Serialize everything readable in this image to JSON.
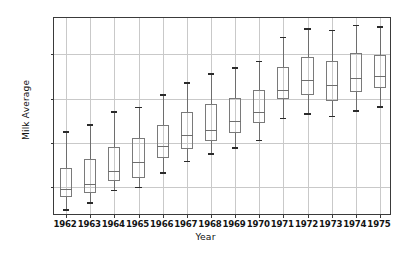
{
  "chart_data": {
    "type": "box",
    "title": "",
    "xlabel": "Year",
    "ylabel": "Milk Average",
    "categories": [
      "1962",
      "1963",
      "1964",
      "1965",
      "1966",
      "1967",
      "1968",
      "1969",
      "1970",
      "1971",
      "1972",
      "1973",
      "1974",
      "1975"
    ],
    "xtick_labels": [
      "1962",
      "1963",
      "1964",
      "1965",
      "1966",
      "1967",
      "1968",
      "1969",
      "1970",
      "1971",
      "1972",
      "1973",
      "1974",
      "1975"
    ],
    "ytick_labels": [
      "600",
      "700",
      "800",
      "900"
    ],
    "yticks": [
      600,
      700,
      800,
      900
    ],
    "ylim": [
      535,
      982
    ],
    "grid": true,
    "legend": null,
    "boxes": [
      {
        "category": "1962",
        "whisker_low": 551,
        "q1": 577,
        "median": 597,
        "q3": 644,
        "whisker_high": 727
      },
      {
        "category": "1963",
        "whisker_low": 566,
        "q1": 586,
        "median": 608,
        "q3": 664,
        "whisker_high": 742
      },
      {
        "category": "1964",
        "whisker_low": 594,
        "q1": 615,
        "median": 636,
        "q3": 691,
        "whisker_high": 771
      },
      {
        "category": "1965",
        "whisker_low": 601,
        "q1": 621,
        "median": 656,
        "q3": 711,
        "whisker_high": 782
      },
      {
        "category": "1966",
        "whisker_low": 634,
        "q1": 665,
        "median": 693,
        "q3": 741,
        "whisker_high": 810
      },
      {
        "category": "1967",
        "whisker_low": 660,
        "q1": 686,
        "median": 717,
        "q3": 770,
        "whisker_high": 837
      },
      {
        "category": "1968",
        "whisker_low": 677,
        "q1": 705,
        "median": 729,
        "q3": 787,
        "whisker_high": 857
      },
      {
        "category": "1969",
        "whisker_low": 690,
        "q1": 723,
        "median": 749,
        "q3": 801,
        "whisker_high": 871
      },
      {
        "category": "1970",
        "whisker_low": 707,
        "q1": 745,
        "median": 769,
        "q3": 819,
        "whisker_high": 886
      },
      {
        "category": "1971",
        "whisker_low": 757,
        "q1": 799,
        "median": 819,
        "q3": 871,
        "whisker_high": 940
      },
      {
        "category": "1972",
        "whisker_low": 767,
        "q1": 808,
        "median": 841,
        "q3": 895,
        "whisker_high": 959
      },
      {
        "category": "1973",
        "whisker_low": 761,
        "q1": 794,
        "median": 830,
        "q3": 886,
        "whisker_high": 956
      },
      {
        "category": "1974",
        "whisker_low": 774,
        "q1": 815,
        "median": 847,
        "q3": 904,
        "whisker_high": 967
      },
      {
        "category": "1975",
        "whisker_low": 783,
        "q1": 825,
        "median": 851,
        "q3": 899,
        "whisker_high": 964
      }
    ]
  },
  "style": {
    "grid_color": "#c9c9c9",
    "axes_color": "#3a3a3a",
    "box_color": "#7a7a7a",
    "cap_color": "#2b2b2b",
    "background": "#ffffff",
    "text_color": "#141414"
  }
}
